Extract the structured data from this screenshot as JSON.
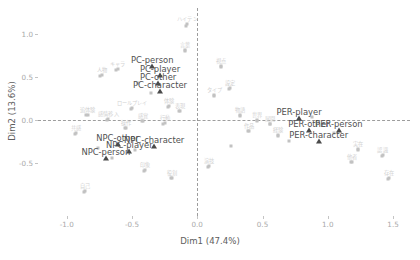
{
  "chart_data": {
    "type": "scatter",
    "title": "",
    "xlabel": "Dim1 (47.4%)",
    "ylabel": "Dim2 (13.6%)",
    "xlim": [
      -1.22,
      1.63
    ],
    "ylim": [
      -1.12,
      1.3
    ],
    "xticks": [
      "-1.0",
      "-0.5",
      "0.0",
      "0.5",
      "1.0",
      "1.5"
    ],
    "xtickvals": [
      -1.0,
      -0.5,
      0.0,
      0.5,
      1.0,
      1.5
    ],
    "yticks": [
      "1.0",
      "0.5",
      "0.0",
      "-0.5"
    ],
    "ytickvals": [
      1.0,
      0.5,
      0.0,
      -0.5
    ],
    "grid": false,
    "legend": "none",
    "reference_lines": {
      "vertical_x": 0.0,
      "horizontal_y": 0.0,
      "style": "dashed"
    },
    "groups": [
      {
        "name": "PC",
        "points": [
          {
            "label": "PC-person",
            "x": -0.345,
            "y": 0.69
          },
          {
            "label": "PC-player",
            "x": -0.285,
            "y": 0.585
          },
          {
            "label": "PC-other",
            "x": -0.3,
            "y": 0.5
          },
          {
            "label": "PC-character",
            "x": -0.285,
            "y": 0.4
          }
        ]
      },
      {
        "name": "NPC",
        "points": [
          {
            "label": "NPC-other",
            "x": -0.61,
            "y": -0.215
          },
          {
            "label": "NPC-character",
            "x": -0.33,
            "y": -0.23
          },
          {
            "label": "NPC-player",
            "x": -0.52,
            "y": -0.295
          },
          {
            "label": "NPC-person",
            "x": -0.7,
            "y": -0.38
          }
        ]
      },
      {
        "name": "PER",
        "points": [
          {
            "label": "PER-player",
            "x": 0.78,
            "y": 0.095
          },
          {
            "label": "PER-other",
            "x": 0.855,
            "y": -0.05
          },
          {
            "label": "PER-person",
            "x": 1.085,
            "y": -0.055
          },
          {
            "label": "PER-character",
            "x": 0.93,
            "y": -0.175
          }
        ]
      }
    ],
    "cloud_points": [
      {
        "x": -0.075,
        "y": 1.185,
        "label": "ハイテン"
      },
      {
        "x": -0.09,
        "y": 0.88,
        "label": "言葉"
      },
      {
        "x": -0.61,
        "y": 0.66,
        "label": "キャラ"
      },
      {
        "x": -0.73,
        "y": 0.585,
        "label": "人物"
      },
      {
        "x": 0.185,
        "y": 0.69,
        "label": "視点"
      },
      {
        "x": 0.25,
        "y": 0.44,
        "label": "設定"
      },
      {
        "x": 0.13,
        "y": 0.355,
        "label": "タイプ"
      },
      {
        "x": -0.215,
        "y": 0.225,
        "label": "体験"
      },
      {
        "x": -0.5,
        "y": 0.205,
        "label": "ロールプレイ"
      },
      {
        "x": -0.13,
        "y": 0.175,
        "label": "表現"
      },
      {
        "x": -0.84,
        "y": 0.13,
        "label": "追体験"
      },
      {
        "x": -0.68,
        "y": 0.075,
        "label": "感情移入"
      },
      {
        "x": -0.415,
        "y": 0.055,
        "label": "感覚"
      },
      {
        "x": -0.25,
        "y": 0.03,
        "label": "行動"
      },
      {
        "x": -0.545,
        "y": -0.03,
        "label": "操作"
      },
      {
        "x": -0.93,
        "y": -0.09,
        "label": "共感"
      },
      {
        "x": 0.33,
        "y": 0.12,
        "label": "物語"
      },
      {
        "x": 0.46,
        "y": 0.065,
        "label": "世界"
      },
      {
        "x": 0.56,
        "y": 0.02,
        "label": "展開"
      },
      {
        "x": 0.395,
        "y": -0.06,
        "label": "作品"
      },
      {
        "x": 0.62,
        "y": -0.11,
        "label": "経験"
      },
      {
        "x": 1.235,
        "y": -0.275,
        "label": "実在"
      },
      {
        "x": 1.185,
        "y": -0.42,
        "label": "他者"
      },
      {
        "x": 1.42,
        "y": -0.345,
        "label": "認識"
      },
      {
        "x": 1.47,
        "y": -0.61,
        "label": "存在"
      },
      {
        "x": -0.86,
        "y": -0.76,
        "label": "自己"
      },
      {
        "x": -0.19,
        "y": -0.605,
        "label": "役割"
      },
      {
        "x": 0.09,
        "y": -0.47,
        "label": "演技"
      },
      {
        "x": -0.4,
        "y": -0.52,
        "label": "印象"
      }
    ],
    "cloud_dots_extra": [
      {
        "x": -0.085,
        "y": 1.085
      },
      {
        "x": -0.095,
        "y": 0.8
      },
      {
        "x": -0.62,
        "y": 0.58
      },
      {
        "x": -0.745,
        "y": 0.505
      },
      {
        "x": 0.18,
        "y": 0.61
      },
      {
        "x": 0.245,
        "y": 0.36
      },
      {
        "x": 0.125,
        "y": 0.28
      },
      {
        "x": -0.225,
        "y": 0.15
      },
      {
        "x": -0.51,
        "y": 0.13
      },
      {
        "x": -0.14,
        "y": 0.1
      },
      {
        "x": -0.85,
        "y": 0.055
      },
      {
        "x": -0.69,
        "y": 0.0
      },
      {
        "x": -0.425,
        "y": -0.02
      },
      {
        "x": -0.26,
        "y": -0.045
      },
      {
        "x": -0.555,
        "y": -0.1
      },
      {
        "x": -0.94,
        "y": -0.165
      },
      {
        "x": 0.325,
        "y": 0.045
      },
      {
        "x": 0.455,
        "y": -0.01
      },
      {
        "x": 0.555,
        "y": -0.055
      },
      {
        "x": 0.39,
        "y": -0.135
      },
      {
        "x": 0.615,
        "y": -0.185
      },
      {
        "x": 1.23,
        "y": -0.35
      },
      {
        "x": 1.18,
        "y": -0.495
      },
      {
        "x": 1.415,
        "y": -0.42
      },
      {
        "x": 1.465,
        "y": -0.685
      },
      {
        "x": -0.87,
        "y": -0.835
      },
      {
        "x": -0.2,
        "y": -0.68
      },
      {
        "x": 0.085,
        "y": -0.545
      },
      {
        "x": -0.41,
        "y": -0.595
      },
      {
        "x": -0.655,
        "y": -0.445
      },
      {
        "x": -0.76,
        "y": -0.33
      },
      {
        "x": -0.48,
        "y": -0.355
      },
      {
        "x": 0.7,
        "y": -0.25
      },
      {
        "x": 0.26,
        "y": -0.3
      },
      {
        "x": 1.05,
        "y": -0.16
      },
      {
        "x": 0.88,
        "y": 0.03
      },
      {
        "x": -0.355,
        "y": 0.31
      },
      {
        "x": -0.455,
        "y": 0.43
      }
    ]
  }
}
